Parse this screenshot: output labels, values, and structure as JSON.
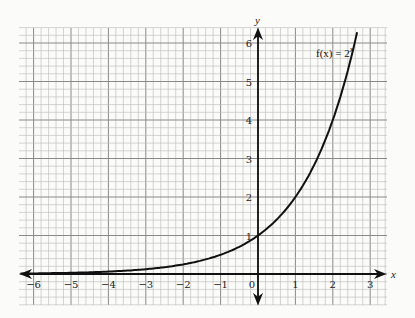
{
  "chart_data": {
    "type": "line",
    "title": "",
    "function_label": "f(x) = 2^x",
    "function_label_parts": {
      "fx": "f(x) = 2",
      "exp": "x"
    },
    "xlabel": "x",
    "ylabel": "y",
    "xlim": [
      -6.4,
      3.4
    ],
    "ylim": [
      -0.8,
      6.4
    ],
    "x_ticks": [
      -6,
      -5,
      -4,
      -3,
      -2,
      -1,
      0,
      1,
      2,
      3
    ],
    "x_tick_labels": [
      "−6",
      "−5",
      "−4",
      "−3",
      "−2",
      "−1",
      "0",
      "1",
      "2",
      "3"
    ],
    "y_ticks": [
      1,
      2,
      3,
      4,
      5,
      6
    ],
    "y_tick_labels": [
      "1",
      "2",
      "3",
      "4",
      "5",
      "6"
    ],
    "grid": {
      "on": true,
      "minor_per_unit": 5,
      "major_every": 1
    },
    "series": [
      {
        "name": "f(x) = 2^x",
        "x": [
          -6,
          -5,
          -4,
          -3,
          -2,
          -1,
          0,
          1,
          2,
          2.5,
          2.65
        ],
        "y": [
          0.016,
          0.031,
          0.063,
          0.125,
          0.25,
          0.5,
          1,
          2,
          4,
          5.66,
          6.28
        ]
      }
    ],
    "asymptote": "y = 0 (horizontal)",
    "y_intercept": [
      0,
      1
    ],
    "colors": {
      "grid_minor": "#b9b9b9",
      "grid_major": "#8a8a8a",
      "curve": "#111111",
      "axis": "#111111"
    }
  }
}
